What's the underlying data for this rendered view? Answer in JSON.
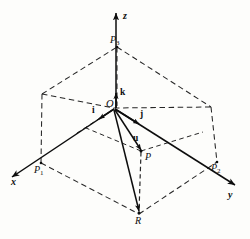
{
  "figure": {
    "kind": "3d-coordinate-system-diagram",
    "background_color": "#fdfdfb",
    "ink_color": "#0d0d0d"
  },
  "axes": [
    {
      "id": "x",
      "label": "x",
      "direction": "down-left",
      "arrow": true
    },
    {
      "id": "y",
      "label": "y",
      "direction": "down-right",
      "arrow": true
    },
    {
      "id": "z",
      "label": "z",
      "direction": "up",
      "arrow": true
    }
  ],
  "points": [
    {
      "id": "O",
      "label": "O",
      "role": "origin"
    },
    {
      "id": "P1",
      "label": "P",
      "sub": "1",
      "role": "x-axis-point"
    },
    {
      "id": "P2",
      "label": "P",
      "sub": "2",
      "role": "y-axis-point"
    },
    {
      "id": "P3",
      "label": "P",
      "sub": "3",
      "role": "z-axis-point"
    },
    {
      "id": "P",
      "label": "P",
      "role": "terminal-point"
    },
    {
      "id": "R",
      "label": "R",
      "role": "xy-plane-projection"
    }
  ],
  "vectors": [
    {
      "id": "i",
      "label": "i",
      "role": "unit-vector-x"
    },
    {
      "id": "j",
      "label": "j",
      "role": "unit-vector-y"
    },
    {
      "id": "k",
      "label": "k",
      "role": "unit-vector-z"
    },
    {
      "id": "u",
      "label": "u",
      "role": "position-vector-OP"
    }
  ]
}
